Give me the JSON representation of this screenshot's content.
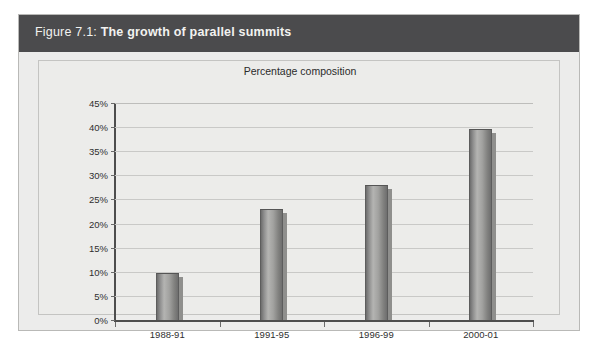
{
  "figure": {
    "caption_prefix": "Figure 7.1:",
    "caption_main": "The growth of parallel summits",
    "caption_full": "Figure 7.1: The growth of parallel summits"
  },
  "colors": {
    "caption_bar": "#4b4b4d",
    "caption_text": "#f2f2f0",
    "panel_background": "#ececea",
    "figure_background": "#ececeb",
    "bar_fill": "#a2a2a0",
    "bar_outline": "#5d5d5d",
    "gridline": "#c9c9c7",
    "axis": "#4d4d4d"
  },
  "chart_data": {
    "type": "bar",
    "title": "Percentage composition",
    "xlabel": "",
    "ylabel": "",
    "categories": [
      "1988-91",
      "1991-95",
      "1996-99",
      "2000-01"
    ],
    "values": [
      9.7,
      23.1,
      27.9,
      39.6
    ],
    "ylim": [
      0,
      45
    ],
    "ytick_values": [
      0,
      5,
      10,
      15,
      20,
      25,
      30,
      35,
      40,
      45
    ],
    "ytick_labels": [
      "0%",
      "5%",
      "10%",
      "15%",
      "20%",
      "25%",
      "30%",
      "35%",
      "40%",
      "45%"
    ],
    "grid": true,
    "legend": null,
    "legend_position": "none",
    "series": [
      {
        "name": "Percentage composition",
        "values": [
          9.7,
          23.1,
          27.9,
          39.6
        ]
      }
    ]
  }
}
